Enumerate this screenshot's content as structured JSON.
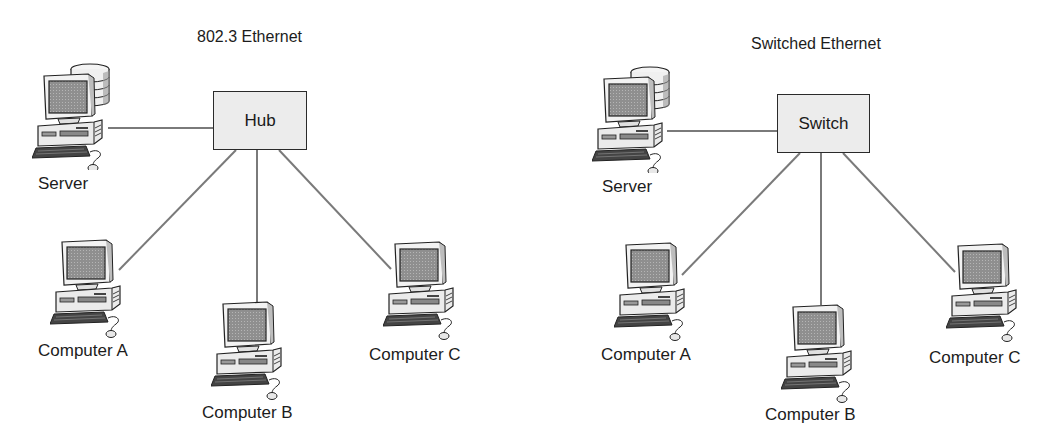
{
  "diagrams": [
    {
      "title": "802.3  Ethernet",
      "center_device": "Hub",
      "server_label": "Server",
      "computers": [
        "Computer A",
        "Computer B",
        "Computer C"
      ]
    },
    {
      "title": "Switched Ethernet",
      "center_device": "Switch",
      "server_label": "Server",
      "computers": [
        "Computer A",
        "Computer B",
        "Computer C"
      ]
    }
  ],
  "colors": {
    "line": "#7a7a7a",
    "box_fill": "#ececec",
    "outline": "#2a2a2a",
    "screen": "#8c8c8c"
  }
}
